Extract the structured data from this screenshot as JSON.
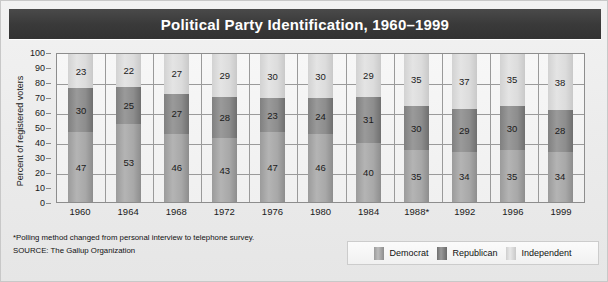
{
  "title": "Political Party Identification, 1960–1999",
  "chart_data": {
    "type": "bar",
    "subtype": "stacked-bar-100",
    "title": "Political Party Identification, 1960–1999",
    "xlabel": "",
    "ylabel": "Percent of registered voters",
    "ylim": [
      0,
      100
    ],
    "ytick_step": 10,
    "yticks": [
      0,
      10,
      20,
      30,
      40,
      50,
      60,
      70,
      80,
      90,
      100
    ],
    "grid": "horizontal-and-vertical",
    "legend_position": "bottom-right",
    "categories": [
      "1960",
      "1964",
      "1968",
      "1972",
      "1976",
      "1980",
      "1984",
      "1988*",
      "1992",
      "1996",
      "1999"
    ],
    "series": [
      {
        "name": "Democrat",
        "color": "#a8a8a8",
        "values": [
          47,
          53,
          46,
          43,
          47,
          46,
          40,
          35,
          34,
          35,
          34
        ]
      },
      {
        "name": "Republican",
        "color": "#8d8d8d",
        "values": [
          30,
          25,
          27,
          28,
          23,
          24,
          31,
          30,
          29,
          30,
          28
        ]
      },
      {
        "name": "Independent",
        "color": "#dcdcdc",
        "values": [
          23,
          22,
          27,
          29,
          30,
          30,
          29,
          35,
          37,
          35,
          38
        ]
      }
    ],
    "annotations": [
      "*Polling method changed from personal interview to telephone survey.",
      "SOURCE: The Gallup Organization"
    ]
  },
  "notes": {
    "footnote": "*Polling method changed from personal interview to telephone survey.",
    "source": "SOURCE: The Gallup Organization"
  },
  "legend": {
    "items": [
      {
        "label": "Democrat"
      },
      {
        "label": "Republican"
      },
      {
        "label": "Independent"
      }
    ]
  },
  "colors": {
    "title_bar": "#3a3a3a",
    "democrat": "#a8a8a8",
    "republican": "#8d8d8d",
    "independent": "#dcdcdc",
    "plot_background": "#f4f4f4",
    "grid": "#9a9a9a"
  }
}
